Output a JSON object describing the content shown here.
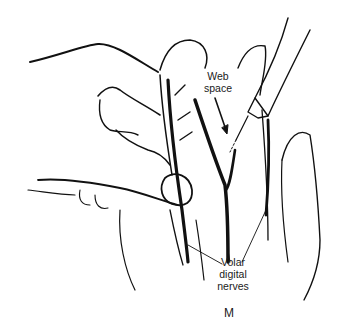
{
  "figure": {
    "panel_letter": "M",
    "labels": {
      "web_space": "Web\nspace",
      "volar_digital_nerves": "Volar\ndigital\nnerves"
    },
    "colors": {
      "line": "#111111",
      "background": "#ffffff"
    }
  }
}
